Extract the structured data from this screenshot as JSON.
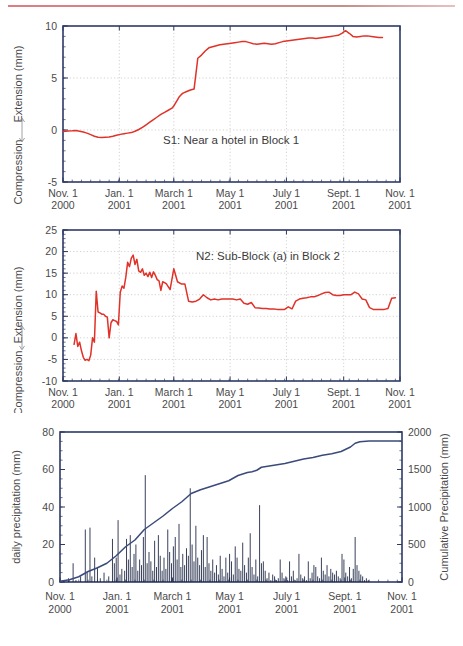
{
  "axis_titles": {
    "extension": "Extension  (mm)",
    "compression": "Compression",
    "daily_precip": "daily precipitation (mm)",
    "cumulative_precip": "Cumulative Precipitation (mm)"
  },
  "xaxis": {
    "ticks": [
      {
        "month": "Nov. 1",
        "year": "2000"
      },
      {
        "month": "Jan. 1",
        "year": "2001"
      },
      {
        "month": "March 1",
        "year": "2001"
      },
      {
        "month": "May 1",
        "year": "2001"
      },
      {
        "month": "July 1",
        "year": "2001"
      },
      {
        "month": "Sept. 1",
        "year": "2001"
      },
      {
        "month": "Nov. 1",
        "year": "2001"
      }
    ]
  },
  "chart_data": [
    {
      "type": "line",
      "title": "S1: Near a hotel in Block 1",
      "xlabel": "",
      "ylabel": "Compression <-> Extension  (mm)",
      "ylim": [
        -5,
        10
      ],
      "yticks": [
        -5,
        0,
        5,
        10
      ],
      "xlim_days": [
        0,
        365
      ],
      "grid": true,
      "series_color": "#e03228",
      "x": [
        0,
        5,
        10,
        14,
        18,
        22,
        26,
        30,
        34,
        38,
        42,
        46,
        50,
        54,
        58,
        62,
        66,
        70,
        74,
        78,
        82,
        86,
        90,
        94,
        98,
        102,
        106,
        110,
        114,
        118,
        120,
        122,
        124,
        126,
        128,
        130,
        134,
        138,
        142,
        146,
        150,
        154,
        158,
        162,
        166,
        170,
        174,
        178,
        182,
        186,
        190,
        194,
        198,
        202,
        206,
        210,
        214,
        218,
        222,
        226,
        230,
        234,
        238,
        242,
        246,
        250,
        254,
        258,
        262,
        266,
        270,
        274,
        278,
        282,
        286,
        290,
        294,
        298,
        302,
        306,
        310,
        314,
        318,
        322,
        326,
        330,
        334,
        338,
        342,
        346
      ],
      "values": [
        -0.15,
        -0.1,
        -0.08,
        -0.05,
        -0.12,
        -0.2,
        -0.3,
        -0.45,
        -0.6,
        -0.7,
        -0.72,
        -0.7,
        -0.68,
        -0.6,
        -0.5,
        -0.42,
        -0.35,
        -0.3,
        -0.25,
        -0.12,
        0.05,
        0.25,
        0.5,
        0.75,
        1.0,
        1.25,
        1.5,
        1.7,
        1.9,
        2.1,
        2.3,
        2.6,
        2.9,
        3.2,
        3.4,
        3.55,
        3.7,
        3.85,
        3.95,
        6.9,
        7.2,
        7.6,
        7.9,
        8.0,
        8.1,
        8.2,
        8.25,
        8.3,
        8.35,
        8.4,
        8.45,
        8.5,
        8.5,
        8.4,
        8.3,
        8.25,
        8.3,
        8.35,
        8.3,
        8.25,
        8.3,
        8.4,
        8.5,
        8.55,
        8.6,
        8.65,
        8.7,
        8.75,
        8.8,
        8.85,
        8.85,
        8.8,
        8.85,
        8.9,
        8.95,
        9.0,
        9.05,
        9.1,
        9.3,
        9.55,
        9.3,
        9.0,
        8.95,
        9.0,
        9.05,
        9.05,
        9.0,
        8.95,
        8.9,
        8.9
      ]
    },
    {
      "type": "line",
      "title": "N2: Sub-Block (a) in Block 2",
      "xlabel": "",
      "ylabel": "Compression <-> Extension  (mm)",
      "ylim": [
        -10,
        25
      ],
      "yticks": [
        -10,
        -5,
        0,
        5,
        10,
        15,
        20,
        25
      ],
      "xlim_days": [
        0,
        365
      ],
      "grid": true,
      "series_color": "#e03228",
      "x": [
        12,
        14,
        16,
        18,
        20,
        22,
        24,
        26,
        28,
        30,
        32,
        34,
        36,
        38,
        40,
        42,
        44,
        46,
        48,
        50,
        52,
        54,
        56,
        58,
        60,
        62,
        64,
        66,
        68,
        70,
        72,
        74,
        76,
        78,
        80,
        82,
        84,
        86,
        88,
        90,
        92,
        94,
        96,
        98,
        100,
        102,
        104,
        106,
        108,
        110,
        112,
        116,
        120,
        124,
        128,
        132,
        136,
        140,
        144,
        148,
        152,
        156,
        160,
        164,
        168,
        172,
        176,
        180,
        184,
        188,
        192,
        196,
        200,
        204,
        208,
        212,
        216,
        220,
        224,
        228,
        232,
        236,
        240,
        244,
        248,
        252,
        256,
        260,
        264,
        268,
        272,
        276,
        280,
        284,
        288,
        292,
        296,
        300,
        304,
        308,
        312,
        316,
        320,
        324,
        328,
        332,
        336,
        340,
        344,
        348,
        352,
        356,
        360
      ],
      "values": [
        -1.5,
        1.0,
        -2.0,
        -1.0,
        -3.0,
        -4.5,
        -5.2,
        -5.0,
        -5.3,
        -4.0,
        0.0,
        -1.0,
        10.8,
        6.0,
        5.8,
        5.5,
        5.5,
        5.0,
        4.8,
        0.0,
        3.5,
        4.2,
        4.0,
        3.8,
        3.0,
        10.5,
        12.0,
        11.5,
        14.0,
        17.5,
        16.5,
        18.5,
        19.2,
        17.0,
        18.2,
        15.5,
        15.2,
        16.0,
        14.5,
        15.0,
        14.2,
        15.2,
        14.0,
        15.3,
        14.5,
        13.5,
        13.2,
        11.0,
        13.0,
        12.8,
        12.5,
        11.2,
        16.0,
        13.0,
        12.5,
        12.5,
        8.5,
        8.3,
        8.5,
        9.0,
        10.0,
        9.3,
        8.8,
        9.0,
        8.8,
        9.0,
        9.0,
        9.0,
        9.0,
        8.8,
        9.0,
        8.0,
        7.8,
        8.2,
        7.0,
        6.9,
        6.8,
        6.8,
        6.7,
        6.7,
        6.6,
        6.6,
        6.6,
        7.2,
        6.7,
        8.5,
        9.0,
        9.2,
        9.3,
        9.5,
        9.5,
        9.8,
        10.2,
        10.5,
        10.6,
        10.0,
        9.8,
        9.8,
        10.0,
        10.0,
        10.0,
        10.6,
        10.2,
        9.0,
        8.8,
        7.0,
        6.6,
        6.6,
        6.6,
        6.6,
        6.8,
        9.2,
        9.3
      ]
    },
    {
      "type": "bar+line",
      "title": "",
      "ylabel": "daily precipitation (mm)",
      "y2label": "Cumulative Precipitation (mm)",
      "ylim": [
        0,
        80
      ],
      "yticks": [
        0,
        20,
        40,
        60,
        80
      ],
      "y2lim": [
        0,
        2000
      ],
      "y2ticks": [
        0,
        500,
        1000,
        1500,
        2000
      ],
      "xlim_days": [
        0,
        365
      ],
      "grid": false,
      "bar_color": "#16203d",
      "line_color": "#3a4a7a",
      "bars": [
        [
          4,
          1
        ],
        [
          9,
          2
        ],
        [
          14,
          10
        ],
        [
          17,
          1
        ],
        [
          22,
          3
        ],
        [
          27,
          28
        ],
        [
          29,
          5
        ],
        [
          32,
          29
        ],
        [
          34,
          3
        ],
        [
          37,
          13
        ],
        [
          40,
          8
        ],
        [
          43,
          2
        ],
        [
          47,
          5
        ],
        [
          52,
          3
        ],
        [
          56,
          23
        ],
        [
          58,
          10
        ],
        [
          60,
          13
        ],
        [
          62,
          33
        ],
        [
          64,
          4
        ],
        [
          66,
          7
        ],
        [
          69,
          6
        ],
        [
          71,
          23
        ],
        [
          73,
          12
        ],
        [
          75,
          25
        ],
        [
          77,
          8
        ],
        [
          79,
          15
        ],
        [
          81,
          20
        ],
        [
          83,
          6
        ],
        [
          85,
          12
        ],
        [
          87,
          9
        ],
        [
          89,
          24
        ],
        [
          91,
          57
        ],
        [
          93,
          10
        ],
        [
          95,
          16
        ],
        [
          97,
          11
        ],
        [
          99,
          6
        ],
        [
          101,
          22
        ],
        [
          103,
          8
        ],
        [
          105,
          25
        ],
        [
          107,
          14
        ],
        [
          109,
          6
        ],
        [
          111,
          13
        ],
        [
          113,
          7
        ],
        [
          115,
          28
        ],
        [
          117,
          16
        ],
        [
          119,
          10
        ],
        [
          121,
          19
        ],
        [
          123,
          24
        ],
        [
          125,
          12
        ],
        [
          127,
          31
        ],
        [
          129,
          8
        ],
        [
          131,
          15
        ],
        [
          133,
          9
        ],
        [
          135,
          18
        ],
        [
          137,
          14
        ],
        [
          139,
          50
        ],
        [
          141,
          20
        ],
        [
          143,
          11
        ],
        [
          145,
          30
        ],
        [
          147,
          13
        ],
        [
          149,
          9
        ],
        [
          151,
          17
        ],
        [
          153,
          25
        ],
        [
          155,
          8
        ],
        [
          157,
          24
        ],
        [
          159,
          10
        ],
        [
          161,
          6
        ],
        [
          163,
          12
        ],
        [
          165,
          5
        ],
        [
          167,
          9
        ],
        [
          169,
          4
        ],
        [
          171,
          14
        ],
        [
          173,
          7
        ],
        [
          175,
          3
        ],
        [
          177,
          13
        ],
        [
          179,
          5
        ],
        [
          181,
          15
        ],
        [
          183,
          11
        ],
        [
          185,
          4
        ],
        [
          187,
          19
        ],
        [
          189,
          13
        ],
        [
          191,
          7
        ],
        [
          193,
          6
        ],
        [
          195,
          21
        ],
        [
          197,
          9
        ],
        [
          199,
          5
        ],
        [
          201,
          13
        ],
        [
          203,
          26
        ],
        [
          205,
          8
        ],
        [
          207,
          4
        ],
        [
          209,
          12
        ],
        [
          211,
          3
        ],
        [
          213,
          41
        ],
        [
          215,
          10
        ],
        [
          217,
          11
        ],
        [
          219,
          6
        ],
        [
          221,
          2
        ],
        [
          223,
          5
        ],
        [
          225,
          1
        ],
        [
          227,
          4
        ],
        [
          229,
          3
        ],
        [
          231,
          1
        ],
        [
          233,
          2
        ],
        [
          235,
          12
        ],
        [
          237,
          5
        ],
        [
          239,
          2
        ],
        [
          241,
          3
        ],
        [
          243,
          1
        ],
        [
          245,
          11
        ],
        [
          247,
          3
        ],
        [
          249,
          6
        ],
        [
          251,
          1
        ],
        [
          253,
          2
        ],
        [
          255,
          15
        ],
        [
          257,
          4
        ],
        [
          259,
          2
        ],
        [
          261,
          3
        ],
        [
          263,
          1
        ],
        [
          265,
          11
        ],
        [
          267,
          2
        ],
        [
          269,
          5
        ],
        [
          271,
          9
        ],
        [
          273,
          8
        ],
        [
          275,
          3
        ],
        [
          277,
          2
        ],
        [
          279,
          13
        ],
        [
          281,
          6
        ],
        [
          283,
          4
        ],
        [
          285,
          9
        ],
        [
          287,
          3
        ],
        [
          289,
          7
        ],
        [
          291,
          5
        ],
        [
          293,
          4
        ],
        [
          295,
          6
        ],
        [
          297,
          3
        ],
        [
          299,
          2
        ],
        [
          301,
          15
        ],
        [
          303,
          12
        ],
        [
          305,
          5
        ],
        [
          307,
          3
        ],
        [
          309,
          8
        ],
        [
          311,
          2
        ],
        [
          313,
          7
        ],
        [
          315,
          24
        ],
        [
          317,
          9
        ],
        [
          319,
          6
        ],
        [
          321,
          4
        ],
        [
          323,
          3
        ],
        [
          325,
          1
        ],
        [
          327,
          2
        ],
        [
          329,
          1
        ]
      ],
      "cumulative_x": [
        0,
        10,
        20,
        30,
        40,
        50,
        60,
        70,
        80,
        90,
        100,
        110,
        120,
        130,
        140,
        150,
        160,
        170,
        180,
        190,
        200,
        205,
        210,
        215,
        220,
        230,
        240,
        250,
        260,
        270,
        280,
        290,
        300,
        310,
        315,
        320,
        330,
        340,
        350,
        365
      ],
      "cumulative_values": [
        10,
        30,
        70,
        140,
        190,
        250,
        350,
        470,
        560,
        700,
        790,
        880,
        980,
        1070,
        1180,
        1230,
        1270,
        1310,
        1350,
        1420,
        1460,
        1470,
        1490,
        1530,
        1540,
        1560,
        1580,
        1610,
        1640,
        1660,
        1690,
        1710,
        1740,
        1800,
        1850,
        1870,
        1880,
        1880,
        1880,
        1880
      ]
    }
  ]
}
